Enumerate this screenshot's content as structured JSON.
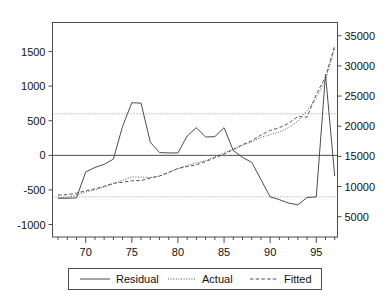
{
  "chart_data": {
    "type": "line",
    "title": "",
    "subtitle": "",
    "xlabel": "",
    "ylabel": "",
    "grid": false,
    "legend_position": "bottom",
    "x": [
      67,
      68,
      69,
      70,
      71,
      72,
      73,
      74,
      75,
      76,
      77,
      78,
      79,
      80,
      81,
      82,
      83,
      84,
      85,
      86,
      87,
      88,
      89,
      90,
      91,
      92,
      93,
      94,
      95,
      96,
      97
    ],
    "x_axis": {
      "ticks_major": [
        70,
        75,
        80,
        85,
        90,
        95
      ],
      "tick_labels": [
        "70",
        "75",
        "80",
        "85",
        "90",
        "95"
      ],
      "minor_tick_step": 1,
      "xlim": [
        66.4,
        97.3
      ]
    },
    "y_axis_left": {
      "ticks": [
        -1000,
        -500,
        0,
        500,
        1000,
        1500
      ],
      "tick_labels": [
        "-1000",
        "-500",
        "0",
        "500",
        "1000",
        "1500"
      ],
      "ylim": [
        -1180,
        1920
      ],
      "belongs_to": "Residual"
    },
    "y_axis_right": {
      "ticks": [
        5000,
        10000,
        15000,
        20000,
        25000,
        30000,
        35000
      ],
      "tick_labels": [
        "5000",
        "10000",
        "15000",
        "20000",
        "25000",
        "30000",
        "35000"
      ],
      "ylim": [
        1630,
        37200
      ],
      "belongs_to": "Actual, Fitted"
    },
    "reference_lines": [
      {
        "value": 600,
        "axis": "left",
        "style": "dotted"
      },
      {
        "value": -600,
        "axis": "left",
        "style": "dotted"
      },
      {
        "value": 0,
        "axis": "left",
        "style": "solid"
      }
    ],
    "series": [
      {
        "name": "Residual",
        "axis": "left",
        "style": "solid",
        "color": "#4d4d4d",
        "values": [
          -620,
          -620,
          -615,
          -240,
          -175,
          -130,
          -55,
          420,
          760,
          755,
          190,
          40,
          35,
          35,
          280,
          400,
          265,
          270,
          400,
          70,
          -30,
          -100,
          -350,
          -600,
          -640,
          -690,
          -715,
          -610,
          -600,
          1170,
          -300
        ]
      },
      {
        "name": "Actual",
        "axis": "right",
        "style": "dotted",
        "color": "#555555",
        "values": [
          8150,
          8200,
          8600,
          9100,
          9450,
          9900,
          10450,
          11050,
          11600,
          11550,
          11500,
          11700,
          12300,
          12950,
          13500,
          13900,
          14300,
          14900,
          15650,
          16150,
          16800,
          17400,
          18150,
          18600,
          19050,
          19750,
          20850,
          22600,
          24600,
          27700,
          32950
        ]
      },
      {
        "name": "Fitted",
        "axis": "right",
        "style": "dashed",
        "color": "#555555",
        "values": [
          8600,
          8650,
          8900,
          9300,
          9600,
          10050,
          10550,
          10700,
          10950,
          11000,
          11400,
          11750,
          12350,
          13000,
          13300,
          13600,
          14150,
          14750,
          15350,
          16150,
          16950,
          17600,
          18550,
          19300,
          19750,
          20500,
          21600,
          21500,
          25300,
          28200,
          33350
        ]
      }
    ],
    "legend": [
      {
        "label": "Residual",
        "style": "solid"
      },
      {
        "label": "Actual",
        "style": "dotted"
      },
      {
        "label": "Fitted",
        "style": "dashed"
      }
    ],
    "colors": {
      "axis": "#4d4d4d",
      "frame": "#4d4d4d",
      "series_line": "#4d4d4d",
      "reference_dotted": "#8a8a8a",
      "background": "#ffffff",
      "text": "#111111"
    }
  }
}
